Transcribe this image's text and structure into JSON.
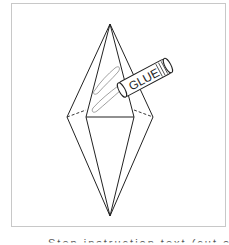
{
  "diagram": {
    "label": "GLUE",
    "caption": "Step instruction text (cut off)",
    "colors": {
      "line": "#222222",
      "frame": "#c8c8c8",
      "glue_smear": "#888888"
    }
  }
}
